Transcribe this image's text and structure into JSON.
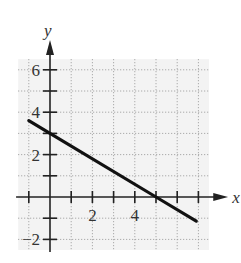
{
  "chart_data": {
    "type": "line",
    "title": "",
    "xlabel": "x",
    "ylabel": "y",
    "xlim": [
      -1,
      7
    ],
    "ylim": [
      -2,
      6
    ],
    "grid": true,
    "grid_style": "dotted",
    "x_ticks": [
      -1,
      1,
      2,
      3,
      4,
      5,
      6,
      7
    ],
    "x_tick_labels": [
      {
        "value": 2,
        "label": "2"
      },
      {
        "value": 4,
        "label": "4"
      }
    ],
    "y_ticks": [
      -2,
      -1,
      1,
      2,
      3,
      4,
      5,
      6
    ],
    "y_tick_labels": [
      {
        "value": 6,
        "label": "6"
      },
      {
        "value": 4,
        "label": "4"
      },
      {
        "value": 2,
        "label": "2"
      },
      {
        "value": -2,
        "label": "−2"
      }
    ],
    "series": [
      {
        "name": "line",
        "equation": "y = -3/5 x + 3",
        "x": [
          -1,
          0,
          5,
          6.9
        ],
        "y": [
          3.6,
          3,
          0,
          -1.14
        ]
      }
    ],
    "colors": {
      "line": "#111111",
      "axis": "#222222",
      "grid": "#999999",
      "grid_background": "#f3f3f3"
    }
  }
}
